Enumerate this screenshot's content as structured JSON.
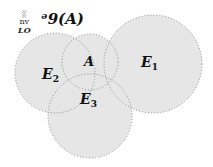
{
  "diagram": {
    "title": "ᵊ9(A)",
    "corner_mark": {
      "symbol": "░",
      "text1": "nv",
      "text2": "LO"
    },
    "fill_color": "#e6e6e6",
    "stroke_color": "#8a8a8a",
    "regions": [
      {
        "id": "E1",
        "label": "E",
        "subscript": "1",
        "cx": 153,
        "cy": 64,
        "r": 49
      },
      {
        "id": "E2",
        "label": "E",
        "subscript": "2",
        "cx": 55,
        "cy": 73,
        "r": 40
      },
      {
        "id": "E3",
        "label": "E",
        "subscript": "3",
        "cx": 90,
        "cy": 116,
        "r": 42
      },
      {
        "id": "A",
        "label": "A",
        "subscript": "",
        "cx": 90,
        "cy": 62,
        "r": 28
      }
    ]
  }
}
